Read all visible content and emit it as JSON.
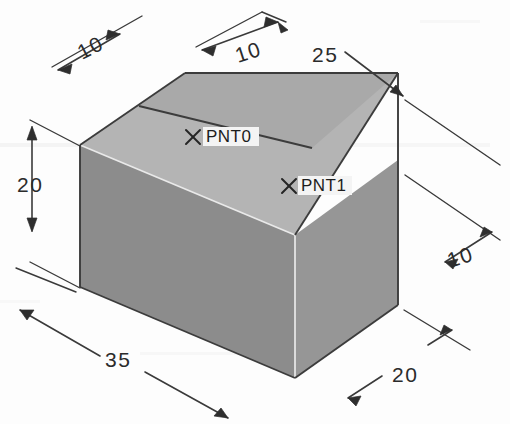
{
  "drawing": {
    "title": "Isometric rectangular block with dimensions",
    "background_color": "#fdfdfd",
    "line_color": "#3a3a3a",
    "faces": {
      "top_face_color": "#b4b4b4",
      "left_face_color": "#8c8c8c",
      "right_face_color": "#969696",
      "top_back_face_color": "#a8a8a8"
    },
    "dimensions": [
      {
        "id": "dim-10-top-left",
        "label": "10",
        "text_x": 82,
        "text_y": 60,
        "rotation": 0
      },
      {
        "id": "dim-10-top-mid",
        "label": "10",
        "text_x": 240,
        "text_y": 62,
        "rotation": 0
      },
      {
        "id": "dim-25-top-right",
        "label": "25",
        "text_x": 316,
        "text_y": 60,
        "rotation": 0
      },
      {
        "id": "dim-20-left",
        "label": "20",
        "text_x": 20,
        "text_y": 195,
        "rotation": 0
      },
      {
        "id": "dim-10-right",
        "label": "10",
        "text_x": 452,
        "text_y": 262,
        "rotation": 0
      },
      {
        "id": "dim-35-bottom",
        "label": "35",
        "text_x": 103,
        "text_y": 365,
        "rotation": 0
      },
      {
        "id": "dim-20-bottom-right",
        "label": "20",
        "text_x": 393,
        "text_y": 375,
        "rotation": 0
      }
    ],
    "points": [
      {
        "id": "pnt0",
        "label": "PNT0",
        "marker_x": 193,
        "marker_y": 137,
        "text_x": 205,
        "text_y": 143
      },
      {
        "id": "pnt1",
        "label": "PNT1",
        "marker_x": 289,
        "marker_y": 186,
        "text_x": 300,
        "text_y": 192
      }
    ]
  }
}
